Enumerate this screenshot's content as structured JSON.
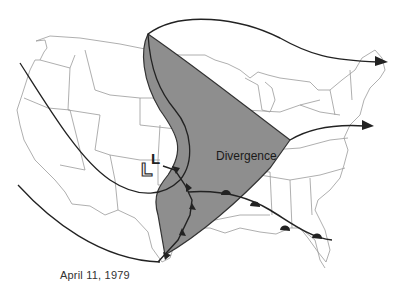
{
  "map": {
    "caption": "April 11, 1979",
    "region_label": "Divergence",
    "low_pressure_symbol": "L",
    "low_pressure_previous_symbol": "L",
    "colors": {
      "divergence_fill": "#8e8e8e",
      "state_lines": "#9a9a9a",
      "jet_lines": "#222222",
      "background": "#ffffff"
    },
    "features": [
      {
        "type": "jet-stream-arrow",
        "direction": "east",
        "ends_at": "New England"
      },
      {
        "type": "jet-stream-arrow",
        "direction": "east",
        "ends_at": "Mid-Atlantic"
      },
      {
        "type": "cold-front",
        "from": "Colorado low",
        "to": "Texas coast"
      },
      {
        "type": "warm-front",
        "from": "Oklahoma",
        "to": "Florida"
      },
      {
        "type": "shaded-region",
        "name": "Divergence"
      }
    ]
  }
}
